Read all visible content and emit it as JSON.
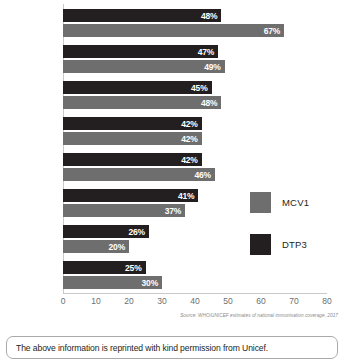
{
  "chart_data": {
    "type": "bar",
    "orientation": "horizontal",
    "title": "",
    "xlabel": "",
    "ylabel": "",
    "xlim": [
      0,
      80
    ],
    "ticks": [
      0,
      10,
      20,
      30,
      40,
      50,
      60,
      70,
      80
    ],
    "grid": false,
    "legend_position": "right",
    "categories": [
      "Syrian Arab Republic",
      "Central African Republic",
      "Guinea",
      "Nigeria",
      "Somalia",
      "Chad",
      "South Sudan",
      "Equatorial Guinea"
    ],
    "series": [
      {
        "name": "DTP3",
        "color": "#231f20",
        "values": [
          48,
          47,
          45,
          42,
          42,
          41,
          26,
          25
        ],
        "labels": [
          "48%",
          "47%",
          "45%",
          "42%",
          "42%",
          "41%",
          "26%",
          "25%"
        ]
      },
      {
        "name": "MCV1",
        "color": "#6e6e6e",
        "values": [
          67,
          49,
          48,
          42,
          46,
          37,
          20,
          30
        ],
        "labels": [
          "67%",
          "49%",
          "48%",
          "42%",
          "46%",
          "37%",
          "20%",
          "30%"
        ]
      }
    ],
    "source": "Source: WHO/UNICEF estimates of national immunisation coverage, 2017"
  },
  "legend": {
    "items": [
      {
        "label": "MCV1",
        "color": "#6e6e6e"
      },
      {
        "label": "DTP3",
        "color": "#231f20"
      }
    ]
  },
  "footer": {
    "permission_text": "The above information is reprinted with kind permission from Unicef."
  }
}
